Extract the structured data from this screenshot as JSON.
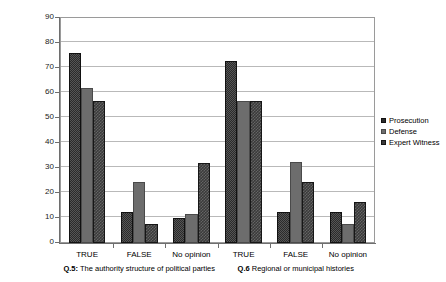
{
  "chart_data": {
    "type": "bar",
    "title": "",
    "subtitle": "",
    "xlabel": "",
    "ylabel": "",
    "ylim": [
      0,
      90
    ],
    "ytick_step": 10,
    "yticks": [
      0,
      10,
      20,
      30,
      40,
      50,
      60,
      70,
      80,
      90
    ],
    "grid": true,
    "legend_position": "right",
    "categories": [
      "TRUE",
      "FALSE",
      "No opinion",
      "TRUE",
      "FALSE",
      "No opinion"
    ],
    "groups": [
      {
        "label_prefix": "Q.5:",
        "label_text": "The authority structure of political parties",
        "categories": [
          "TRUE",
          "FALSE",
          "No opinion"
        ]
      },
      {
        "label_prefix": "Q.6",
        "label_text": "Regional or municipal histories",
        "categories": [
          "TRUE",
          "FALSE",
          "No opinion"
        ]
      }
    ],
    "series": [
      {
        "name": "Prosecution",
        "color": "#2b2b2b",
        "values": [
          76,
          12.5,
          10,
          73,
          12.5,
          12.5
        ]
      },
      {
        "name": "Defense",
        "color": "#6d6d6d",
        "values": [
          62,
          24.5,
          11.5,
          57,
          32.5,
          7.5
        ]
      },
      {
        "name": "Expert Witness",
        "color": "#3a3a3a",
        "values": [
          57,
          7.5,
          32,
          57,
          24.5,
          16.5
        ]
      }
    ]
  },
  "legend": {
    "items": [
      {
        "label": "Prosecution"
      },
      {
        "label": "Defense"
      },
      {
        "label": "Expert Witness"
      }
    ]
  }
}
